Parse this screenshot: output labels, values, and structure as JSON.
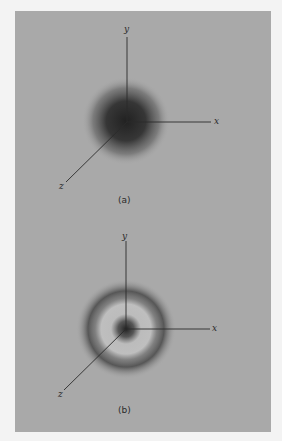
{
  "figure": {
    "panels": [
      {
        "id": "a",
        "caption": "(a)",
        "axes": {
          "x": "x",
          "y": "y",
          "z": "z"
        },
        "description": "spherical probability density cloud centered at origin"
      },
      {
        "id": "b",
        "caption": "(b)",
        "axes": {
          "x": "x",
          "y": "y",
          "z": "z"
        },
        "description": "dense core at origin surrounded by a node and an outer spherical shell"
      }
    ],
    "colors": {
      "background": "#a9a9a9",
      "page": "#f3f3f3",
      "density": "#1e1e1e",
      "axis": "#2a2a2a"
    }
  }
}
